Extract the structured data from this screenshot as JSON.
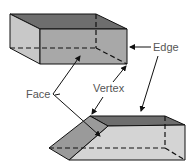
{
  "diagram": {
    "type": "geometry-solids",
    "labels": {
      "edge": "Edge",
      "face": "Face",
      "vertex": "Vertex"
    },
    "colors": {
      "top_face": "#6e6e6e",
      "front_face": "#a8a8a8",
      "side_face": "#c8c8c8",
      "slanted_face": "#9a9a9a",
      "light_face": "#d4d4d4",
      "line": "#111111",
      "label": "#555555"
    }
  }
}
